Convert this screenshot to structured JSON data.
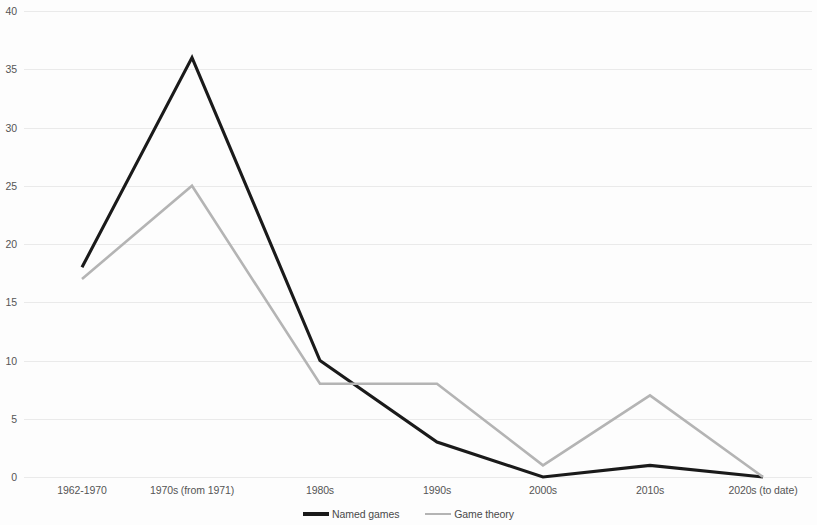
{
  "chart_data": {
    "type": "line",
    "title": "",
    "subtitle": "",
    "xlabel": "",
    "ylabel": "",
    "ylim": [
      0,
      40
    ],
    "ytick_values": [
      0,
      5,
      10,
      15,
      20,
      25,
      30,
      35,
      40
    ],
    "ytick_labels": [
      "0",
      "5",
      "10",
      "15",
      "20",
      "25",
      "30",
      "35",
      "40"
    ],
    "grid": true,
    "grid_axis": "y",
    "legend_position": "bottom",
    "categories": [
      "1962-1970",
      "1970s (from 1971)",
      "1980s",
      "1990s",
      "2000s",
      "2010s",
      "2020s (to date)"
    ],
    "series": [
      {
        "name": "Named games",
        "color": "#1a1a1a",
        "values": [
          18,
          36,
          10,
          3,
          0,
          1,
          0
        ]
      },
      {
        "name": "Game theory",
        "color": "#b4b4b4",
        "values": [
          17,
          25,
          8,
          8,
          1,
          7,
          0
        ]
      }
    ]
  }
}
